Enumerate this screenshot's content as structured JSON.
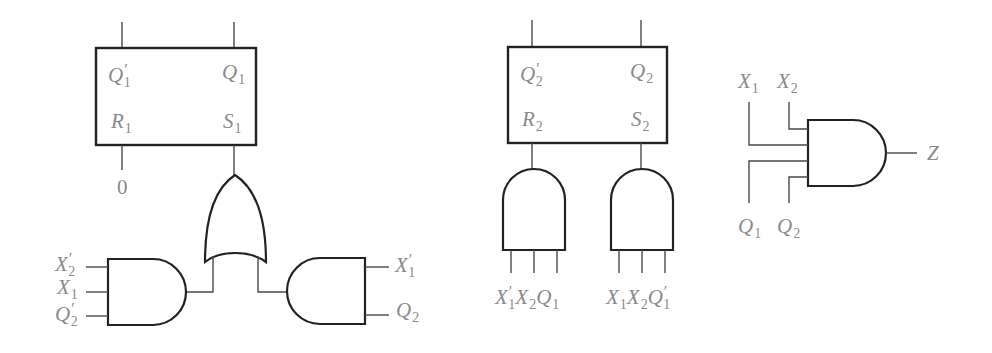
{
  "diagram": {
    "type": "sequential-logic-circuit",
    "colors": {
      "line": "#222222",
      "label": "#8a8a8a",
      "background": "#ffffff"
    },
    "flipflop1": {
      "labels": {
        "q_bar": {
          "base": "Q",
          "prime": "′",
          "sub": "1"
        },
        "q": {
          "base": "Q",
          "prime": "",
          "sub": "1"
        },
        "r": {
          "base": "R",
          "prime": "",
          "sub": "1"
        },
        "s": {
          "base": "S",
          "prime": "",
          "sub": "1"
        }
      },
      "r_input_value": "0"
    },
    "or_gate_s1": {
      "output_to": "S1"
    },
    "and_gate_left": {
      "inputs": [
        {
          "base": "X",
          "prime": "′",
          "sub": "2"
        },
        {
          "base": "X",
          "prime": "",
          "sub": "1"
        },
        {
          "base": "Q",
          "prime": "′",
          "sub": "2"
        }
      ]
    },
    "and_gate_right": {
      "inputs": [
        {
          "base": "X",
          "prime": "′",
          "sub": "1"
        },
        {
          "base": "Q",
          "prime": "",
          "sub": "2"
        }
      ]
    },
    "flipflop2": {
      "labels": {
        "q_bar": {
          "base": "Q",
          "prime": "′",
          "sub": "2"
        },
        "q": {
          "base": "Q",
          "prime": "",
          "sub": "2"
        },
        "r": {
          "base": "R",
          "prime": "",
          "sub": "2"
        },
        "s": {
          "base": "S",
          "prime": "",
          "sub": "2"
        }
      }
    },
    "and_gate_r2": {
      "inputs": [
        {
          "base": "X",
          "prime": "′",
          "sub": "1"
        },
        {
          "base": "X",
          "prime": "",
          "sub": "2"
        },
        {
          "base": "Q",
          "prime": "",
          "sub": "1"
        }
      ]
    },
    "and_gate_s2": {
      "inputs": [
        {
          "base": "X",
          "prime": "",
          "sub": "1"
        },
        {
          "base": "X",
          "prime": "",
          "sub": "2"
        },
        {
          "base": "Q",
          "prime": "′",
          "sub": "1"
        }
      ]
    },
    "and_gate_z": {
      "inputs_top": [
        {
          "base": "X",
          "prime": "",
          "sub": "1"
        },
        {
          "base": "X",
          "prime": "",
          "sub": "2"
        }
      ],
      "inputs_bottom": [
        {
          "base": "Q",
          "prime": "",
          "sub": "1"
        },
        {
          "base": "Q",
          "prime": "",
          "sub": "2"
        }
      ],
      "output": "Z"
    }
  }
}
